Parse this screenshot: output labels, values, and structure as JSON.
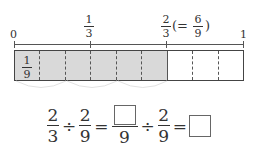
{
  "number_line": {
    "labels": {
      "zero": "0",
      "one_third": {
        "num": "1",
        "den": "3"
      },
      "two_thirds": {
        "num": "2",
        "den": "3"
      },
      "equiv_open": "(=",
      "six_ninths": {
        "num": "6",
        "den": "9"
      },
      "equiv_close": ")",
      "one": "1"
    }
  },
  "tape": {
    "segments": 9,
    "shaded_segments": 6,
    "first_segment_label": {
      "num": "1",
      "den": "9"
    },
    "shade_color": "#d9d9d9",
    "arc_groups": 3
  },
  "equation": {
    "f1": {
      "num": "2",
      "den": "3"
    },
    "op1": "÷",
    "f2": {
      "num": "2",
      "den": "9"
    },
    "eq1": "=",
    "f3": {
      "num": "",
      "den": "9"
    },
    "op2": "÷",
    "f4": {
      "num": "2",
      "den": "9"
    },
    "eq2": "=",
    "answer": ""
  }
}
